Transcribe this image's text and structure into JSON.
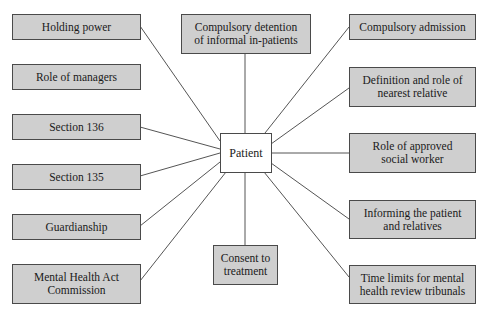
{
  "diagram": {
    "center": {
      "label": "Patient"
    },
    "nodes": [
      {
        "id": "holding-power",
        "label": "Holding power"
      },
      {
        "id": "role-of-managers",
        "label": "Role of managers"
      },
      {
        "id": "section-136",
        "label": "Section 136"
      },
      {
        "id": "section-135",
        "label": "Section 135"
      },
      {
        "id": "guardianship",
        "label": "Guardianship"
      },
      {
        "id": "mha-commission",
        "label": "Mental Health Act Commission"
      },
      {
        "id": "compulsory-detention",
        "label": "Compulsory detention of informal in-patients"
      },
      {
        "id": "consent-to-treatment",
        "label": "Consent to treatment"
      },
      {
        "id": "compulsory-admission",
        "label": "Compulsory admission"
      },
      {
        "id": "nearest-relative",
        "label": "Definition and role of nearest relative"
      },
      {
        "id": "approved-social-worker",
        "label": "Role of approved social worker"
      },
      {
        "id": "informing-patient",
        "label": "Informing the patient and relatives"
      },
      {
        "id": "time-limits",
        "label": "Time limits for mental health review tribunals"
      }
    ],
    "connections": [
      "holding-power",
      "section-136",
      "section-135",
      "guardianship",
      "mha-commission",
      "compulsory-detention",
      "consent-to-treatment",
      "compulsory-admission",
      "nearest-relative",
      "approved-social-worker",
      "informing-patient",
      "time-limits"
    ],
    "colors": {
      "box_fill": "#cfcfcf",
      "center_fill": "#ffffff",
      "border": "#4a4a4a",
      "line": "#555555"
    }
  }
}
